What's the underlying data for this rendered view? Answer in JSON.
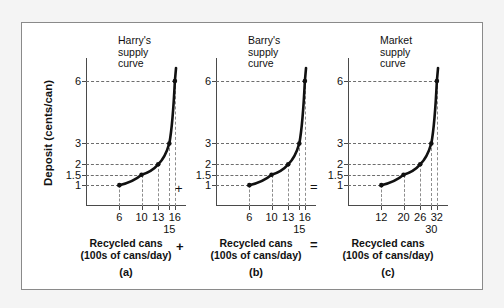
{
  "figure": {
    "y_axis_title": "Deposit (cents/can)",
    "operators": {
      "plus_top": "+",
      "equals_top": "=",
      "plus_bottom": "+",
      "equals_bottom": "="
    }
  },
  "chart_data": [
    {
      "type": "line",
      "title": "Harry's\nsupply\ncurve",
      "panel_label": "(a)",
      "xlabel": "Recycled cans\n(100s of cans/day)",
      "ylabel": "Deposit (cents/can)",
      "x": [
        6,
        10,
        13,
        15,
        16
      ],
      "y": [
        1,
        1.5,
        2,
        3,
        6
      ],
      "xtick_labels": [
        "6",
        "10",
        "13",
        "16"
      ],
      "xtick_values": [
        6,
        10,
        13,
        16
      ],
      "xtick_offset_labels": [
        "15"
      ],
      "xtick_offset_values": [
        15
      ],
      "ytick_labels": [
        "1",
        "1.5",
        "2",
        "3",
        "6"
      ],
      "ytick_values": [
        1,
        1.5,
        2,
        3,
        6
      ],
      "xlim": [
        0,
        18
      ],
      "ylim": [
        0,
        7.1
      ],
      "grid": "dashed-to-points",
      "legend": "none"
    },
    {
      "type": "line",
      "title": "Barry's\nsupply\ncurve",
      "panel_label": "(b)",
      "xlabel": "Recycled cans\n(100s of cans/day)",
      "ylabel": "Deposit (cents/can)",
      "x": [
        6,
        10,
        13,
        15,
        16
      ],
      "y": [
        1,
        1.5,
        2,
        3,
        6
      ],
      "xtick_labels": [
        "6",
        "10",
        "13",
        "16"
      ],
      "xtick_values": [
        6,
        10,
        13,
        16
      ],
      "xtick_offset_labels": [
        "15"
      ],
      "xtick_offset_values": [
        15
      ],
      "ytick_labels": [
        "1",
        "1.5",
        "2",
        "3",
        "6"
      ],
      "ytick_values": [
        1,
        1.5,
        2,
        3,
        6
      ],
      "xlim": [
        0,
        18
      ],
      "ylim": [
        0,
        7.1
      ],
      "grid": "dashed-to-points",
      "legend": "none"
    },
    {
      "type": "line",
      "title": "Market\nsupply\ncurve",
      "panel_label": "(c)",
      "xlabel": "Recycled cans\n(100s of cans/day)",
      "ylabel": "Deposit (cents/can)",
      "x": [
        12,
        20,
        26,
        30,
        32
      ],
      "y": [
        1,
        1.5,
        2,
        3,
        6
      ],
      "xtick_labels": [
        "12",
        "20",
        "26",
        "32"
      ],
      "xtick_values": [
        12,
        20,
        26,
        32
      ],
      "xtick_offset_labels": [
        "30"
      ],
      "xtick_offset_values": [
        30
      ],
      "ytick_labels": [
        "1",
        "1.5",
        "2",
        "3",
        "6"
      ],
      "ytick_values": [
        1,
        1.5,
        2,
        3,
        6
      ],
      "xlim": [
        0,
        36
      ],
      "ylim": [
        0,
        7.1
      ],
      "grid": "dashed-to-points",
      "legend": "none"
    }
  ]
}
